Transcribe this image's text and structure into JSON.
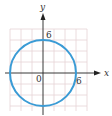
{
  "diagram": {
    "type": "coordinate-plane-graph",
    "axes": {
      "x_label": "x",
      "y_label": "y",
      "origin_label": "0"
    },
    "tick_labels": {
      "x_intercept": "6",
      "y_intercept": "6"
    },
    "curve": {
      "shape": "circle",
      "center": [
        0,
        0
      ],
      "radius": 6,
      "color": "#3a9bd5"
    },
    "grid": {
      "visible": true,
      "spacing_units": 2,
      "color": "#e0c8cc"
    },
    "axis_color": "#222222"
  }
}
